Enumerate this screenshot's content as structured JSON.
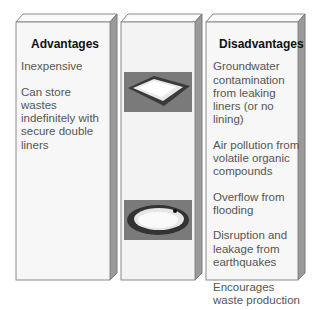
{
  "advantages": {
    "heading": "Advantages",
    "items": [
      "Inexpensive",
      "Can store wastes indefinitely with secure double liners"
    ]
  },
  "images": [
    {
      "icon": "rectangular-lined-pond-icon"
    },
    {
      "icon": "oval-lined-pond-icon"
    }
  ],
  "disadvantages": {
    "heading": "Disadvantages",
    "items": [
      "Groundwater contamination from leaking liners (or no lining)",
      "Air pollution from volatile organic compounds",
      "Overflow from flooding",
      "Disruption and leakage from earthquakes",
      "Encourages waste production"
    ]
  },
  "colors": {
    "face": "#f7f7f7",
    "side": "#9a9a9a",
    "outline": "#8a8a8a",
    "photo_bg": "#7a7a7a"
  }
}
